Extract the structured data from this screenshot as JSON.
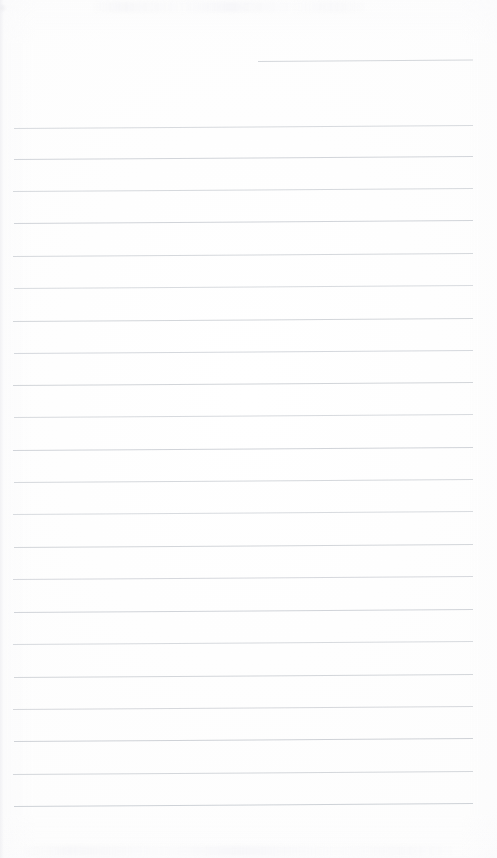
{
  "document": {
    "kind": "scanned-lined-notebook-page",
    "title": "Blank ruled notebook page",
    "page_width": 497,
    "page_height": 858,
    "background_color": "#fdfdfd",
    "rule_color": "#cfd2d6",
    "rule_color_faint": "#dddfe3",
    "content_text": "",
    "has_handwriting": false,
    "has_printed_text": false,
    "has_margin_rule": false,
    "scan_tilt_degrees": -0.38,
    "rule_spacing_px": 32.3,
    "rule_left_x": 13,
    "rule_right_x": 473,
    "rule_count": 23,
    "notes": "Empty page: no text, headings, numbers or marks are rendered in the pixels."
  },
  "rules": [
    {
      "id": "rule-header",
      "y": 61,
      "x": 258,
      "width": 215,
      "weight": 1,
      "color": "#d2d5d9",
      "opacity": 0.95,
      "partial": true
    },
    {
      "id": "rule-01",
      "y": 128,
      "x": 14,
      "width": 459,
      "weight": 1,
      "color": "#d4d7db",
      "opacity": 0.92,
      "partial": false
    },
    {
      "id": "rule-02",
      "y": 159,
      "x": 14,
      "width": 459,
      "weight": 1,
      "color": "#d0d3d8",
      "opacity": 0.95,
      "partial": false
    },
    {
      "id": "rule-03",
      "y": 191,
      "x": 13,
      "width": 460,
      "weight": 1,
      "color": "#d3d6da",
      "opacity": 0.92,
      "partial": false
    },
    {
      "id": "rule-04",
      "y": 223,
      "x": 14,
      "width": 459,
      "weight": 1,
      "color": "#cfd2d7",
      "opacity": 0.95,
      "partial": false
    },
    {
      "id": "rule-05",
      "y": 256,
      "x": 13,
      "width": 460,
      "weight": 1,
      "color": "#d2d5d9",
      "opacity": 0.93,
      "partial": false
    },
    {
      "id": "rule-06",
      "y": 288,
      "x": 14,
      "width": 459,
      "weight": 1,
      "color": "#d4d7dc",
      "opacity": 0.9,
      "partial": false
    },
    {
      "id": "rule-07",
      "y": 321,
      "x": 13,
      "width": 460,
      "weight": 1,
      "color": "#d0d3d8",
      "opacity": 0.94,
      "partial": false
    },
    {
      "id": "rule-08",
      "y": 353,
      "x": 14,
      "width": 459,
      "weight": 1,
      "color": "#d2d5da",
      "opacity": 0.93,
      "partial": false
    },
    {
      "id": "rule-09",
      "y": 385,
      "x": 13,
      "width": 460,
      "weight": 1,
      "color": "#d0d3d7",
      "opacity": 0.95,
      "partial": false
    },
    {
      "id": "rule-10",
      "y": 417,
      "x": 14,
      "width": 459,
      "weight": 1,
      "color": "#d3d6db",
      "opacity": 0.91,
      "partial": false
    },
    {
      "id": "rule-11",
      "y": 450,
      "x": 13,
      "width": 460,
      "weight": 1,
      "color": "#cfd2d7",
      "opacity": 0.95,
      "partial": false
    },
    {
      "id": "rule-12",
      "y": 482,
      "x": 14,
      "width": 459,
      "weight": 1,
      "color": "#d2d5d9",
      "opacity": 0.93,
      "partial": false
    },
    {
      "id": "rule-13",
      "y": 514,
      "x": 13,
      "width": 460,
      "weight": 1,
      "color": "#d4d7dc",
      "opacity": 0.9,
      "partial": false
    },
    {
      "id": "rule-14",
      "y": 547,
      "x": 14,
      "width": 459,
      "weight": 1,
      "color": "#d0d3d8",
      "opacity": 0.94,
      "partial": false
    },
    {
      "id": "rule-15",
      "y": 579,
      "x": 13,
      "width": 460,
      "weight": 1,
      "color": "#d2d5da",
      "opacity": 0.92,
      "partial": false
    },
    {
      "id": "rule-16",
      "y": 612,
      "x": 14,
      "width": 459,
      "weight": 1,
      "color": "#cfd2d7",
      "opacity": 0.95,
      "partial": false
    },
    {
      "id": "rule-17",
      "y": 644,
      "x": 13,
      "width": 460,
      "weight": 1,
      "color": "#d3d6db",
      "opacity": 0.91,
      "partial": false
    },
    {
      "id": "rule-18",
      "y": 677,
      "x": 14,
      "width": 459,
      "weight": 1,
      "color": "#d0d3d8",
      "opacity": 0.94,
      "partial": false
    },
    {
      "id": "rule-19",
      "y": 709,
      "x": 13,
      "width": 460,
      "weight": 1,
      "color": "#d2d5d9",
      "opacity": 0.92,
      "partial": false
    },
    {
      "id": "rule-20",
      "y": 741,
      "x": 14,
      "width": 459,
      "weight": 1,
      "color": "#cdd0d5",
      "opacity": 0.96,
      "partial": false
    },
    {
      "id": "rule-21",
      "y": 774,
      "x": 13,
      "width": 460,
      "weight": 1,
      "color": "#d1d4d9",
      "opacity": 0.94,
      "partial": false
    },
    {
      "id": "rule-22",
      "y": 806,
      "x": 14,
      "width": 459,
      "weight": 1,
      "color": "#ccd0d5",
      "opacity": 0.96,
      "partial": false
    }
  ],
  "artifacts": [
    {
      "id": "ghost-band-bottom",
      "y": 846,
      "x": 18,
      "width": 440
    },
    {
      "id": "ghost-band-top",
      "y": 2,
      "x": 90,
      "width": 280
    }
  ]
}
